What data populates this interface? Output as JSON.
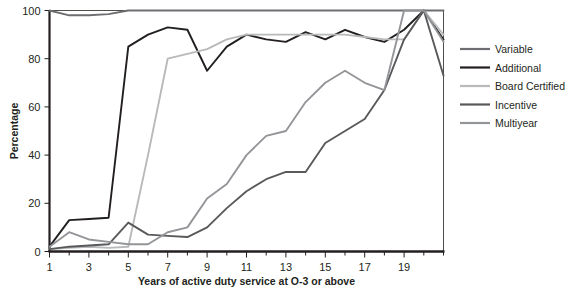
{
  "chart_data": {
    "type": "line",
    "title": "",
    "xlabel": "Years of active duty service at O-3 or above",
    "ylabel": "Percentage",
    "xlim": [
      1,
      21
    ],
    "ylim": [
      0,
      100
    ],
    "grid": false,
    "legend_position": "right",
    "x": [
      1,
      2,
      3,
      4,
      5,
      6,
      7,
      8,
      9,
      10,
      11,
      12,
      13,
      14,
      15,
      16,
      17,
      18,
      19,
      20,
      21
    ],
    "x_tick_values": [
      1,
      2,
      3,
      4,
      5,
      6,
      7,
      8,
      9,
      10,
      11,
      12,
      13,
      14,
      15,
      16,
      17,
      18,
      19,
      20,
      21
    ],
    "x_tick_labels": [
      "1",
      "",
      "3",
      "",
      "5",
      "",
      "7",
      "",
      "9",
      "",
      "11",
      "",
      "13",
      "",
      "15",
      "",
      "17",
      "",
      "19",
      "",
      ""
    ],
    "y_tick_values": [
      0,
      20,
      40,
      60,
      80,
      100
    ],
    "y_tick_labels": [
      "0",
      "20",
      "40",
      "60",
      "80",
      "100"
    ],
    "series": [
      {
        "name": "Variable",
        "color": "#6d6e71",
        "values": [
          100,
          98,
          98,
          98.5,
          100,
          100,
          100,
          100,
          100,
          100,
          100,
          100,
          100,
          100,
          100,
          100,
          100,
          100,
          100,
          100,
          100
        ]
      },
      {
        "name": "Additional",
        "color": "#231f20",
        "values": [
          2,
          13,
          13.5,
          14,
          85,
          90,
          93,
          92,
          75,
          85,
          90,
          88,
          87,
          91,
          88,
          92,
          89,
          87,
          92,
          100,
          88
        ]
      },
      {
        "name": "Board Certified",
        "color": "#b7b9bb",
        "values": [
          1,
          1.5,
          2,
          1.5,
          2,
          40,
          80,
          82,
          84,
          88,
          90,
          90,
          90,
          90,
          90,
          90,
          89,
          88,
          88,
          100,
          90
        ]
      },
      {
        "name": "Incentive",
        "color": "#58595b",
        "values": [
          1,
          2,
          2.5,
          3,
          12,
          7,
          6.5,
          6,
          10,
          18,
          25,
          30,
          33,
          33,
          45,
          50,
          55,
          67,
          88,
          100,
          73
        ]
      },
      {
        "name": "Multiyear",
        "color": "#939598",
        "values": [
          2,
          8,
          5,
          4,
          3,
          3,
          8,
          10,
          22,
          28,
          40,
          48,
          50,
          62,
          70,
          75,
          70,
          67,
          100,
          100,
          87
        ]
      }
    ]
  },
  "legend": {
    "items": [
      {
        "label": "Variable"
      },
      {
        "label": "Additional"
      },
      {
        "label": "Board Certified"
      },
      {
        "label": "Incentive"
      },
      {
        "label": "Multiyear"
      }
    ]
  }
}
